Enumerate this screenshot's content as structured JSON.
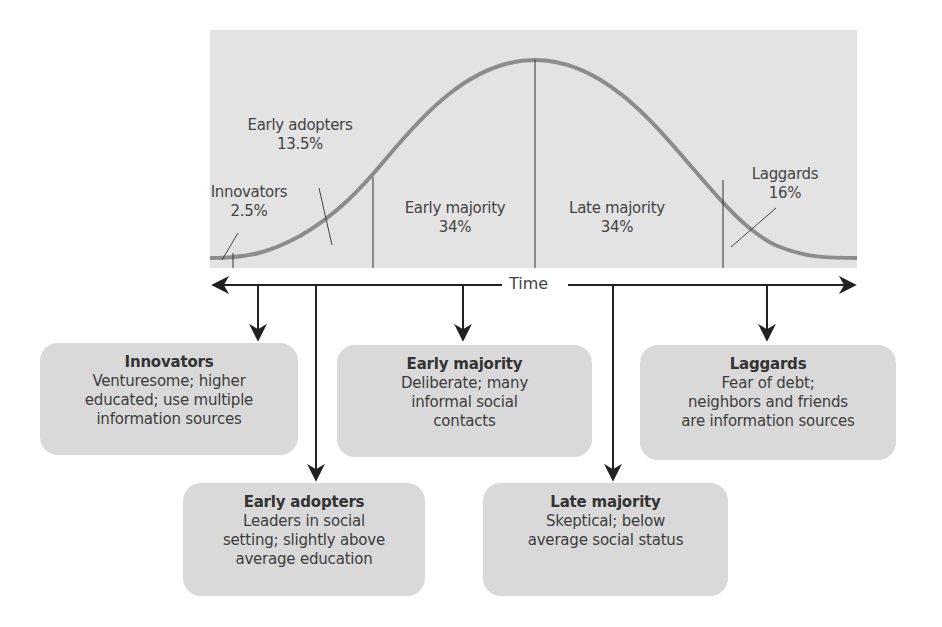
{
  "diagram": {
    "type": "diffusion-of-innovation-bell-curve",
    "axis": {
      "label": "Time"
    },
    "colors": {
      "chart_bg": "#e3e3e3",
      "curve": "#8c8c8c",
      "box_bg": "#d9d9d9",
      "line": "#222222"
    },
    "segments": [
      {
        "name": "Innovators",
        "percent": "2.5%"
      },
      {
        "name": "Early adopters",
        "percent": "13.5%"
      },
      {
        "name": "Early majority",
        "percent": "34%"
      },
      {
        "name": "Late majority",
        "percent": "34%"
      },
      {
        "name": "Laggards",
        "percent": "16%"
      }
    ],
    "boxes": [
      {
        "title": "Innovators",
        "lines": [
          "Venturesome; higher",
          "educated; use multiple",
          "information sources"
        ]
      },
      {
        "title": "Early adopters",
        "lines": [
          "Leaders in social",
          "setting; slightly above",
          "average education"
        ]
      },
      {
        "title": "Early majority",
        "lines": [
          "Deliberate; many",
          "informal social",
          "contacts"
        ]
      },
      {
        "title": "Late majority",
        "lines": [
          "Skeptical; below",
          "average social status"
        ]
      },
      {
        "title": "Laggards",
        "lines": [
          "Fear of debt;",
          "neighbors and friends",
          "are information sources"
        ]
      }
    ]
  }
}
